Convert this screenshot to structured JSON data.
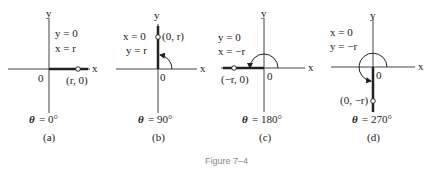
{
  "figure": {
    "caption": "Figure 7–4",
    "panels": [
      {
        "id": "a",
        "sublabel": "(a)",
        "eq1": "y = 0",
        "eq2": "x = r",
        "point": "(r, 0)",
        "origin": "0",
        "x_axis": "x",
        "y_axis": "y",
        "angle_theta": "θ",
        "angle_value": "= 0°"
      },
      {
        "id": "b",
        "sublabel": "(b)",
        "eq1": "x = 0",
        "eq2": "y = r",
        "point": "(0, r)",
        "origin": "0",
        "x_axis": "x",
        "y_axis": "y",
        "angle_theta": "θ",
        "angle_value": "= 90°"
      },
      {
        "id": "c",
        "sublabel": "(c)",
        "eq1": "y = 0",
        "eq2": "x = −r",
        "point": "(−r, 0)",
        "origin": "0",
        "x_axis": "x",
        "y_axis": "y",
        "angle_theta": "θ",
        "angle_value": "= 180°"
      },
      {
        "id": "d",
        "sublabel": "(d)",
        "eq1": "x = 0",
        "eq2": "y = −r",
        "point": "(0, −r)",
        "origin": "0",
        "x_axis": "x",
        "y_axis": "y",
        "angle_theta": "θ",
        "angle_value": "= 270°"
      }
    ]
  }
}
